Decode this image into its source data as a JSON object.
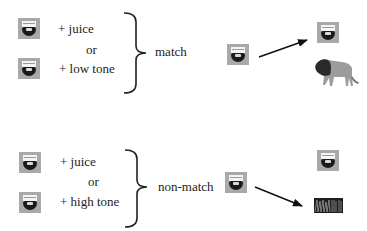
{
  "match_group": {
    "line1": "+  juice",
    "or": "or",
    "line2": "+ low tone",
    "label": "match"
  },
  "nonmatch_group": {
    "line1": "+  juice",
    "or": "or",
    "line2": "+ high tone",
    "label": "non-match"
  },
  "icons": {
    "face": "face-icon",
    "lion": "lion-image",
    "noise": "noise-spectrogram-image"
  },
  "colors": {
    "icon_bg": "#a9a9a9",
    "ink": "#222222"
  }
}
